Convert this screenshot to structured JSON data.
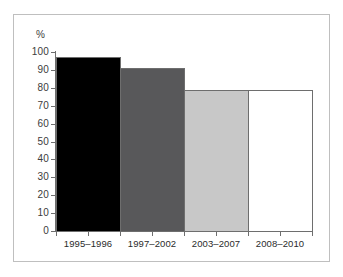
{
  "chart_data": {
    "type": "bar",
    "title": "",
    "xlabel": "",
    "ylabel": "%",
    "categories": [
      "1995–1996",
      "1997–2002",
      "2003–2007",
      "2008–2010"
    ],
    "values": [
      97,
      91,
      79,
      79
    ],
    "ylim": [
      0,
      100
    ],
    "yticks": [
      0,
      10,
      20,
      30,
      40,
      50,
      60,
      70,
      80,
      90,
      100
    ],
    "ytick_labels": [
      "0",
      "10",
      "20",
      "30",
      "40",
      "50",
      "60",
      "70",
      "80",
      "90",
      "100"
    ],
    "grid": false,
    "legend": "none",
    "bar_colors": [
      "#000000",
      "#58585a",
      "#c8c8c8",
      "#ffffff"
    ],
    "bar_edge_color": "#6e6e6e",
    "axis_color": "#6e6e6e",
    "frame_color": "#bfbfbf",
    "background": "#ffffff",
    "series": [
      {
        "name": "percentage",
        "values": [
          97,
          91,
          79,
          79
        ]
      }
    ]
  }
}
